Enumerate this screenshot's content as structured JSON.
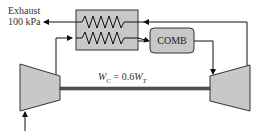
{
  "diagram": {
    "exhaust_label_line1": "Exhaust",
    "exhaust_label_line2": "100 kPa",
    "combustor_label": "COMB",
    "work_relation": {
      "lhs": "W",
      "lhs_sub": "C",
      "middle": " = 0.6",
      "rhs": "W",
      "rhs_sub": "T"
    },
    "components": [
      "heat-exchanger (regenerator)",
      "combustor",
      "compressor",
      "turbine",
      "shaft"
    ],
    "colors": {
      "component_fill": "#c8c8c8",
      "stroke": "#222222",
      "text": "#333333"
    }
  }
}
